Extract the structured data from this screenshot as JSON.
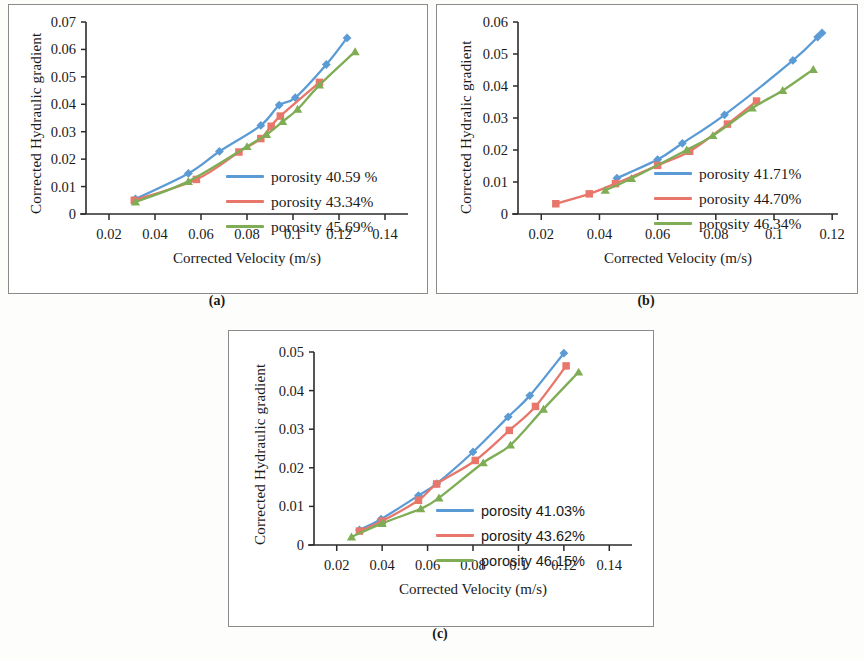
{
  "figure": {
    "panels": [
      {
        "id": "a",
        "caption": "(a)",
        "ylabel": "Corrected Hydraulic gradient",
        "xlabel": "Corrected  Velocity  (m/s)",
        "legend_font": "serif"
      },
      {
        "id": "b",
        "caption": "(b)",
        "ylabel": "Corrected Hydralic gradient",
        "xlabel": "Corrected  Velocity  (m/s)",
        "legend_font": "serif"
      },
      {
        "id": "c",
        "caption": "(c)",
        "ylabel": "Corrected Hydraulic gradient",
        "xlabel": "Corrected  Velocity  (m/s)",
        "legend_font": "sans"
      }
    ]
  },
  "colors": {
    "series1": "#5b9bd5",
    "series2": "#e8766a",
    "series3": "#7fad56",
    "axis": "#2b2b2b",
    "frame": "#8b8b8b",
    "text": "#1a1a1a"
  },
  "chart_data": [
    {
      "panel": "a",
      "type": "scatter",
      "title": "",
      "xlabel": "Corrected  Velocity  (m/s)",
      "ylabel": "Corrected Hydraulic gradient",
      "xlim": [
        0.01,
        0.15
      ],
      "ylim": [
        0,
        0.07
      ],
      "xticks": [
        "0.02",
        "0.04",
        "0.06",
        "0.08",
        "0.1",
        "0.12",
        "0.14"
      ],
      "xtick_values": [
        0.02,
        0.04,
        0.06,
        0.08,
        0.1,
        0.12,
        0.14
      ],
      "yticks": [
        "0",
        "0.01",
        "0.02",
        "0.03",
        "0.04",
        "0.05",
        "0.06",
        "0.07"
      ],
      "ytick_values": [
        0,
        0.01,
        0.02,
        0.03,
        0.04,
        0.05,
        0.06,
        0.07
      ],
      "grid": false,
      "legend_position": "inside-right-lower",
      "series": [
        {
          "name": "porosity 40.59 %",
          "color": "#5b9bd5",
          "marker": "diamond",
          "x": [
            0.0315,
            0.0545,
            0.068,
            0.086,
            0.094,
            0.101,
            0.1145,
            0.1235
          ],
          "y": [
            0.0055,
            0.0148,
            0.0228,
            0.0323,
            0.0397,
            0.0424,
            0.0545,
            0.0642
          ]
        },
        {
          "name": "porosity 43.34%",
          "color": "#e8766a",
          "marker": "square",
          "x": [
            0.031,
            0.058,
            0.0765,
            0.086,
            0.0905,
            0.0945,
            0.1115
          ],
          "y": [
            0.005,
            0.0126,
            0.0226,
            0.0275,
            0.032,
            0.0357,
            0.048
          ]
        },
        {
          "name": "porosity 45.69%",
          "color": "#7fad56",
          "marker": "triangle",
          "x": [
            0.0315,
            0.0545,
            0.08,
            0.0885,
            0.0955,
            0.102,
            0.1115,
            0.127
          ],
          "y": [
            0.0044,
            0.0119,
            0.0246,
            0.029,
            0.0337,
            0.0382,
            0.047,
            0.0592
          ]
        }
      ]
    },
    {
      "panel": "b",
      "type": "scatter",
      "title": "",
      "xlabel": "Corrected  Velocity  (m/s)",
      "ylabel": "Corrected Hydralic gradient",
      "xlim": [
        0.012,
        0.122
      ],
      "ylim": [
        0,
        0.06
      ],
      "xticks": [
        "0.02",
        "0.04",
        "0.06",
        "0.08",
        "0.1",
        "0.12"
      ],
      "xtick_values": [
        0.02,
        0.04,
        0.06,
        0.08,
        0.1,
        0.12
      ],
      "yticks": [
        "0",
        "0.01",
        "0.02",
        "0.03",
        "0.04",
        "0.05",
        "0.06"
      ],
      "ytick_values": [
        0,
        0.01,
        0.02,
        0.03,
        0.04,
        0.05,
        0.06
      ],
      "grid": false,
      "legend_position": "inside-right-lower",
      "series": [
        {
          "name": "porosity 41.71%",
          "color": "#5b9bd5",
          "marker": "diamond",
          "x": [
            0.046,
            0.06,
            0.0685,
            0.083,
            0.1065,
            0.115,
            0.1165
          ],
          "y": [
            0.0112,
            0.017,
            0.0221,
            0.031,
            0.048,
            0.0553,
            0.0566
          ]
        },
        {
          "name": "porosity 44.70%",
          "color": "#e8766a",
          "marker": "square",
          "x": [
            0.025,
            0.0365,
            0.0455,
            0.06,
            0.071,
            0.084,
            0.094
          ],
          "y": [
            0.0032,
            0.0063,
            0.0095,
            0.0152,
            0.0196,
            0.0281,
            0.0353
          ]
        },
        {
          "name": "porosity 46.34%",
          "color": "#7fad56",
          "marker": "triangle",
          "x": [
            0.042,
            0.051,
            0.07,
            0.079,
            0.0925,
            0.103,
            0.1135
          ],
          "y": [
            0.0074,
            0.0111,
            0.02,
            0.0245,
            0.0331,
            0.0386,
            0.0452
          ]
        }
      ]
    },
    {
      "panel": "c",
      "type": "scatter",
      "title": "",
      "xlabel": "Corrected  Velocity  (m/s)",
      "ylabel": "Corrected Hydraulic gradient",
      "xlim": [
        0.01,
        0.15
      ],
      "ylim": [
        0,
        0.05
      ],
      "xticks": [
        "0.02",
        "0.04",
        "0.06",
        "0.08",
        "0.1",
        "0.12",
        "0.14"
      ],
      "xtick_values": [
        0.02,
        0.04,
        0.06,
        0.08,
        0.1,
        0.12,
        0.14
      ],
      "yticks": [
        "0",
        "0.01",
        "0.02",
        "0.03",
        "0.04",
        "0.05"
      ],
      "ytick_values": [
        0,
        0.01,
        0.02,
        0.03,
        0.04,
        0.05
      ],
      "grid": false,
      "legend_position": "inside-right-lower",
      "series": [
        {
          "name": "porosity 41.03%",
          "color": "#5b9bd5",
          "marker": "diamond",
          "x": [
            0.03,
            0.0395,
            0.056,
            0.064,
            0.08,
            0.0955,
            0.105,
            0.12
          ],
          "y": [
            0.0039,
            0.0067,
            0.0128,
            0.0159,
            0.0241,
            0.0332,
            0.0387,
            0.0497
          ]
        },
        {
          "name": "porosity 43.62%",
          "color": "#e8766a",
          "marker": "square",
          "x": [
            0.03,
            0.04,
            0.056,
            0.064,
            0.081,
            0.096,
            0.1075,
            0.121
          ],
          "y": [
            0.0036,
            0.0062,
            0.0116,
            0.0158,
            0.0219,
            0.0297,
            0.0359,
            0.0464
          ]
        },
        {
          "name": "porosity 46.15%",
          "color": "#7fad56",
          "marker": "triangle",
          "x": [
            0.0265,
            0.04,
            0.057,
            0.065,
            0.0845,
            0.0965,
            0.111,
            0.1265
          ],
          "y": [
            0.0021,
            0.0056,
            0.0094,
            0.0122,
            0.0213,
            0.0259,
            0.0352,
            0.0448
          ]
        }
      ]
    }
  ]
}
